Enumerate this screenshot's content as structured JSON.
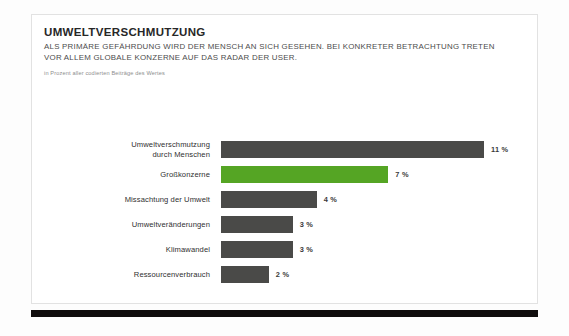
{
  "card": {
    "title": "UMWELTVERSCHMUTZUNG",
    "subtitle": "ALS PRIMÄRE GEFÄHRDUNG WIRD DER MENSCH AN SICH GESEHEN. BEI KONKRETER BETRACHTUNG TRETEN VOR ALLEM GLOBALE KONZERNE AUF DAS RADAR DER USER.",
    "caption": "in Prozent aller codierten Beiträge des Wertes"
  },
  "colors": {
    "bar_default": "#4a4a48",
    "bar_accent": "#55a524",
    "rule": "#100d0d",
    "card_background": "#ffffff",
    "card_border": "#e2e2e2"
  },
  "chart_data": {
    "type": "bar",
    "orientation": "horizontal",
    "title": "UMWELTVERSCHMUTZUNG",
    "subtitle": "ALS PRIMÄRE GEFÄHRDUNG WIRD DER MENSCH AN SICH GESEHEN. BEI KONKRETER BETRACHTUNG TRETEN VOR ALLEM GLOBALE KONZERNE AUF DAS RADAR DER USER.",
    "xlabel": "",
    "ylabel": "",
    "unit": "%",
    "note": "in Prozent aller codierten Beiträge des Wertes",
    "xlim": [
      0,
      11
    ],
    "grid": false,
    "legend": false,
    "categories": [
      "Umweltverschmutzung\ndurch Menschen",
      "Großkonzerne",
      "Missachtung der Umwelt",
      "Umweltveränderungen",
      "Klimawandel",
      "Ressourcenverbrauch"
    ],
    "values": [
      11,
      7,
      4,
      3,
      3,
      2
    ],
    "value_labels": [
      "11 %",
      "7 %",
      "4 %",
      "3 %",
      "3 %",
      "2 %"
    ],
    "highlight_index": 1,
    "bars": [
      {
        "label": "Umweltverschmutzung\ndurch Menschen",
        "value": 11,
        "value_label": "11 %",
        "highlight": false
      },
      {
        "label": "Großkonzerne",
        "value": 7,
        "value_label": "7 %",
        "highlight": true
      },
      {
        "label": "Missachtung der Umwelt",
        "value": 4,
        "value_label": "4 %",
        "highlight": false
      },
      {
        "label": "Umweltveränderungen",
        "value": 3,
        "value_label": "3 %",
        "highlight": false
      },
      {
        "label": "Klimawandel",
        "value": 3,
        "value_label": "3 %",
        "highlight": false
      },
      {
        "label": "Ressourcenverbrauch",
        "value": 2,
        "value_label": "2 %",
        "highlight": false
      }
    ]
  }
}
